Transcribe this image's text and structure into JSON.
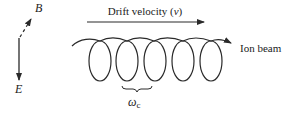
{
  "diagram": {
    "field_b": {
      "label": "B"
    },
    "field_e": {
      "label": "E"
    },
    "drift": {
      "label": "Drift velocity (v)",
      "prefix": "Drift velocity (",
      "var": "v",
      "suffix": ")"
    },
    "beam": {
      "label": "Ion beam"
    },
    "frequency": {
      "label": "ωc",
      "symbol": "ω",
      "subscript": "c"
    },
    "loops": 5,
    "colors": {
      "stroke": "#2a2a2a",
      "text": "#222222"
    }
  }
}
